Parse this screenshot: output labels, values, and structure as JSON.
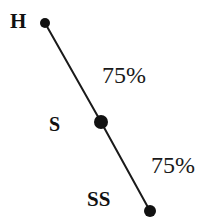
{
  "diagram": {
    "type": "linkage-chain",
    "background_color": "#ffffff",
    "line_color": "#1a1a1a",
    "node_color": "#111111",
    "nodes": [
      {
        "id": "H",
        "label": "H",
        "x": 45,
        "y": 23,
        "radius": 5
      },
      {
        "id": "S",
        "label": "S",
        "x": 101,
        "y": 122,
        "radius": 7
      },
      {
        "id": "SS",
        "label": "SS",
        "x": 150,
        "y": 211,
        "radius": 6
      }
    ],
    "edges": [
      {
        "from": "H",
        "to": "S",
        "label": "75%",
        "x1": 45,
        "y1": 23,
        "x2": 101,
        "y2": 122
      },
      {
        "from": "S",
        "to": "SS",
        "label": "75%",
        "x1": 101,
        "y1": 122,
        "x2": 150,
        "y2": 211
      }
    ]
  }
}
